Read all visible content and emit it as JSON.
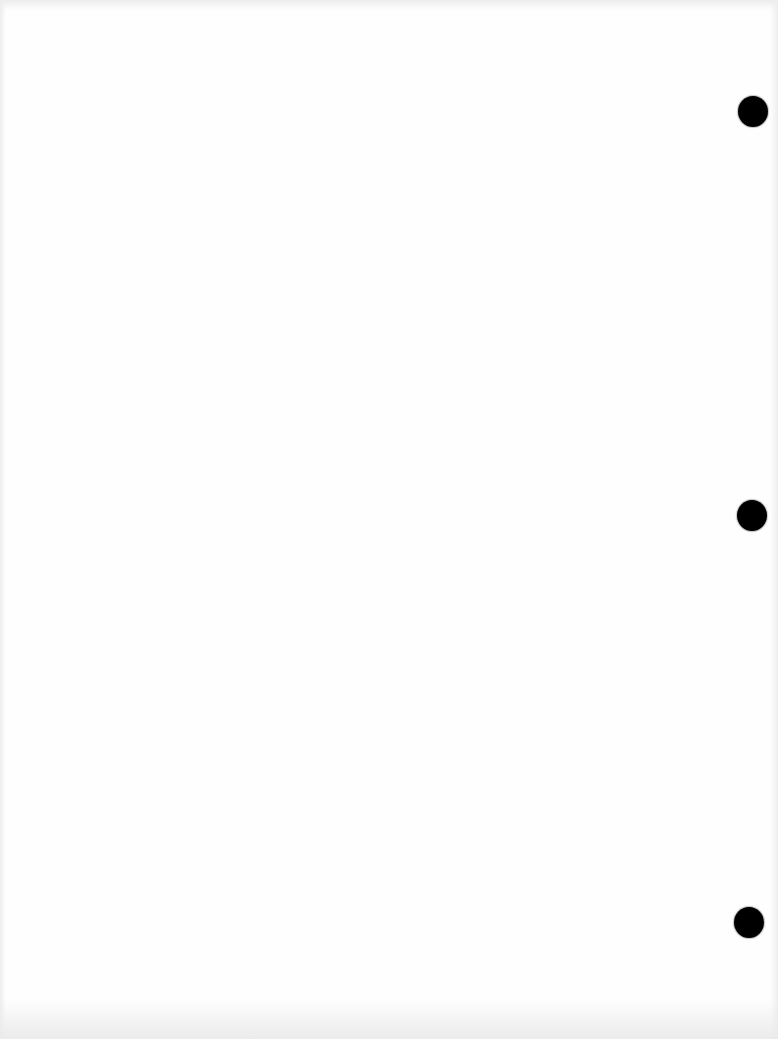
{
  "document": {
    "type": "blank scanned page",
    "text_content": "",
    "background_color": "#fefefe",
    "punch_holes": [
      {
        "cx": 753,
        "cy": 111,
        "diameter": 30,
        "color": "#000000"
      },
      {
        "cx": 752,
        "cy": 515,
        "diameter": 30,
        "color": "#000000"
      },
      {
        "cx": 749,
        "cy": 922,
        "diameter": 30,
        "color": "#000000"
      }
    ]
  }
}
